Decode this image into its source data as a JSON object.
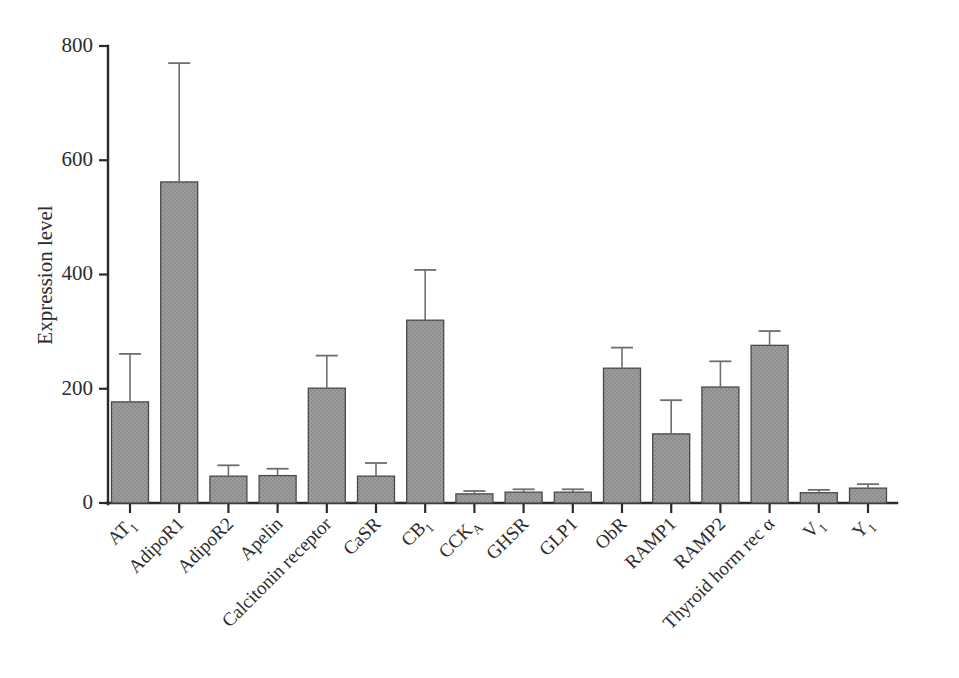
{
  "chart_data": {
    "type": "bar",
    "title": "",
    "xlabel": "",
    "ylabel": "Expression level",
    "ylim": [
      0,
      800
    ],
    "yticks": [
      0,
      200,
      400,
      600,
      800
    ],
    "ytick_labels": [
      "0",
      "200",
      "400",
      "600",
      "800"
    ],
    "grid": false,
    "legend": false,
    "error_bars": "upper only",
    "categories": [
      "AT₁",
      "AdipoR1",
      "AdipoR2",
      "Apelin",
      "Calcitonin receptor",
      "CaSR",
      "CB₁",
      "CCKₐ",
      "GHSR",
      "GLP1",
      "ObR",
      "RAMP1",
      "RAMP2",
      "Thyroid horm rec α",
      "V₁",
      "Y₁"
    ],
    "category_parts": [
      {
        "base": "AT",
        "sub": "1"
      },
      {
        "base": "AdipoR1",
        "sub": ""
      },
      {
        "base": "AdipoR2",
        "sub": ""
      },
      {
        "base": "Apelin",
        "sub": ""
      },
      {
        "base": "Calcitonin receptor",
        "sub": ""
      },
      {
        "base": "CaSR",
        "sub": ""
      },
      {
        "base": "CB",
        "sub": "1"
      },
      {
        "base": "CCK",
        "sub": "A"
      },
      {
        "base": "GHSR",
        "sub": ""
      },
      {
        "base": "GLP1",
        "sub": ""
      },
      {
        "base": "ObR",
        "sub": ""
      },
      {
        "base": "RAMP1",
        "sub": ""
      },
      {
        "base": "RAMP2",
        "sub": ""
      },
      {
        "base": "Thyroid horm rec α",
        "sub": ""
      },
      {
        "base": "V",
        "sub": "1"
      },
      {
        "base": "Y",
        "sub": "1"
      }
    ],
    "values": [
      177,
      562,
      47,
      48,
      201,
      47,
      320,
      16,
      19,
      19,
      236,
      121,
      203,
      276,
      18,
      26
    ],
    "error_upper": [
      261,
      770,
      66,
      60,
      258,
      70,
      408,
      21,
      24,
      24,
      272,
      180,
      248,
      301,
      23,
      33
    ],
    "bar_color": "#9a9a9a",
    "bar_edge_color": "#4a4a4a",
    "error_bar_color": "#6e6e6e",
    "axis_color": "#2a2a2a",
    "background": "#ffffff"
  },
  "axis": {
    "y_title": "Expression level"
  }
}
